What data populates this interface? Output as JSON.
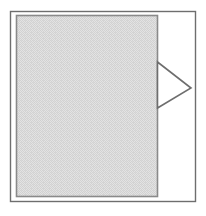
{
  "figure": {
    "type": "line-art-diagram",
    "title": "",
    "caption": "",
    "width": 206,
    "height": 216,
    "background_color": "#ffffff"
  },
  "outer_frame": {
    "name": "outer border frame",
    "shape": "rectangle",
    "x": 10.5,
    "y": 11.5,
    "width": 185,
    "height": 190,
    "stroke_color": "#6e6e6e",
    "stroke_width": 1.4,
    "fill": "none"
  },
  "panel": {
    "name": "shaded rectangular panel",
    "shape": "rectangle",
    "x": 16.5,
    "y": 15.5,
    "width": 141,
    "height": 181,
    "fill_color": "#dcdcdc",
    "stroke_color": "#8a8a8a",
    "stroke_width": 1.6,
    "fill_style": "dithered-halftone-gray"
  },
  "pointer": {
    "name": "right pointing triangle marker",
    "shape": "triangle",
    "direction": "right",
    "fill": "none",
    "fill_color": "#ffffff",
    "stroke_color": "#6e6e6e",
    "stroke_width": 1.6,
    "points": [
      {
        "x": 157.5,
        "y": 62.0
      },
      {
        "x": 191.0,
        "y": 88.0
      },
      {
        "x": 157.5,
        "y": 108.0
      }
    ]
  },
  "labels": []
}
